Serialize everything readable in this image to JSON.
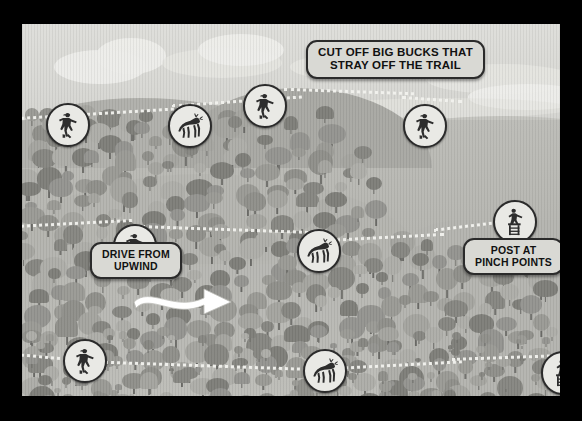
{
  "illustration": {
    "title": "Deer Drive Hunting Strategy Map",
    "scene": "forested ridge with dotted deer trails, hunters and deer markers"
  },
  "callouts": [
    {
      "id": "cut-off",
      "line1": "CUT OFF BIG BUCKS THAT",
      "line2": "STRAY OFF THE TRAIL"
    },
    {
      "id": "drive",
      "line1": "DRIVE FROM",
      "line2": "UPWIND"
    },
    {
      "id": "post",
      "line1": "POST AT",
      "line2": "PINCH POINTS"
    }
  ],
  "markers": [
    {
      "id": "m1",
      "icon": "hunter-icon",
      "x": 24,
      "y": 79,
      "size": 40
    },
    {
      "id": "m2",
      "icon": "deer-icon",
      "x": 146,
      "y": 80,
      "size": 40
    },
    {
      "id": "m3",
      "icon": "hunter-icon",
      "x": 221,
      "y": 60,
      "size": 40
    },
    {
      "id": "m4",
      "icon": "hunter-icon",
      "x": 381,
      "y": 80,
      "size": 40
    },
    {
      "id": "m5",
      "icon": "hunter-treestand-icon",
      "x": 471,
      "y": 176,
      "size": 40
    },
    {
      "id": "m6",
      "icon": "hunter-icon",
      "x": 91,
      "y": 200,
      "size": 40
    },
    {
      "id": "m7",
      "icon": "deer-icon",
      "x": 275,
      "y": 205,
      "size": 40
    },
    {
      "id": "m8",
      "icon": "hunter-icon",
      "x": 41,
      "y": 315,
      "size": 40
    },
    {
      "id": "m9",
      "icon": "deer-icon",
      "x": 281,
      "y": 325,
      "size": 40
    },
    {
      "id": "m10",
      "icon": "hunter-treestand-icon",
      "x": 519,
      "y": 327,
      "size": 40
    }
  ],
  "wind_arrow": {
    "name": "wind-direction-arrow",
    "direction": "right"
  },
  "trails": [
    {
      "id": "trail-top",
      "label": "upper ridge deer trail"
    },
    {
      "id": "trail-middle",
      "label": "mid-slope deer trail"
    },
    {
      "id": "trail-bottom",
      "label": "lower deer trail"
    }
  ],
  "colors": {
    "frame": "#000000",
    "sky": "#dedeDA",
    "forest": "#b9b9b4",
    "trail": "#f2f2ee",
    "pill_fill": "#d9d9d4",
    "pill_border": "#2b2b2b",
    "marker_fill": "#e9e9e5",
    "arrow": "#ffffff"
  }
}
